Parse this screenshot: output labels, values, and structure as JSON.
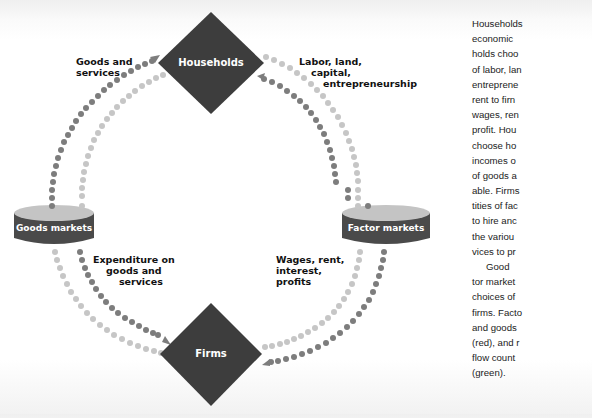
{
  "diagram": {
    "nodes": {
      "households": {
        "label": "Households"
      },
      "firms": {
        "label": "Firms"
      },
      "goods_markets": {
        "label": "Goods markets"
      },
      "factor_markets": {
        "label": "Factor markets"
      }
    },
    "flows": {
      "goods_and_services": {
        "lines": [
          "Goods  and",
          "services"
        ]
      },
      "factors": {
        "lines": [
          "Labor, land,",
          "capital,",
          "entrepreneurship"
        ]
      },
      "expenditure": {
        "lines": [
          "Expenditure on",
          "goods and",
          "services"
        ]
      },
      "incomes": {
        "lines": [
          "Wages, rent,",
          "interest,",
          "profits"
        ]
      }
    },
    "colors": {
      "node_fill": "#3d3d3d",
      "market_band": "#4a4a4a",
      "market_top": "#bdbdbd",
      "real_flow_dots": "#7a7a7a",
      "money_flow_dots": "#c4c4c4"
    }
  },
  "sidebar_text": {
    "lines": [
      "Households",
      "economic",
      "holds choo",
      "of labor, lan",
      "entreprene",
      "rent to firn",
      "wages, ren",
      "profit. Hou",
      "choose ho",
      "incomes o",
      "of goods a",
      "able. Firms",
      "tities of fac",
      "to hire anc",
      "the variou",
      "vices to pr",
      "Good",
      "tor market",
      "choices of",
      "firms. Facto",
      "and goods",
      "(red), and r",
      "flow count",
      "(green)."
    ]
  }
}
